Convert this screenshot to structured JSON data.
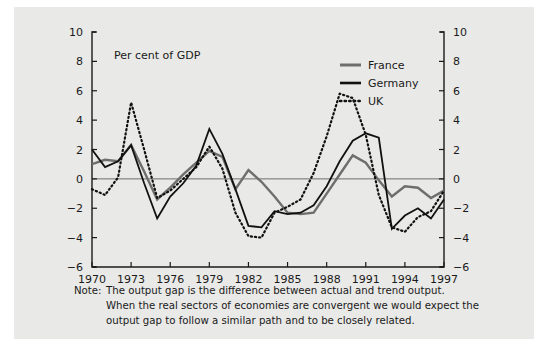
{
  "figure": {
    "background_color": "#e9e9e7",
    "subtitle": "Per cent of GDP",
    "note_label": "Note:",
    "note_lines": [
      "The output gap is the difference between actual and trend output.",
      "When the real sectors of economies are convergent we would expect the",
      "output gap to follow a similar path and to be closely related."
    ]
  },
  "chart_data": {
    "type": "line",
    "title": "",
    "subtitle": "Per cent of GDP",
    "xlabel": "",
    "ylabel": "",
    "ylim": [
      -6,
      10
    ],
    "xlim": [
      1970,
      1997
    ],
    "grid": false,
    "zero_line": true,
    "legend_position": "top-right",
    "y_ticks": [
      10,
      8,
      6,
      4,
      2,
      0,
      -2,
      -4,
      -6
    ],
    "y_tick_labels": [
      "10",
      "8",
      "6",
      "4",
      "2",
      "0",
      "-2",
      "-4",
      "-6"
    ],
    "y_axis_right_labels": [
      "10",
      "8",
      "6",
      "4",
      "2",
      "0",
      "-2",
      "-4",
      "-6"
    ],
    "x_ticks": [
      1970,
      1973,
      1976,
      1979,
      1982,
      1985,
      1988,
      1991,
      1994,
      1997
    ],
    "x_tick_labels": [
      "1970",
      "1973",
      "1976",
      "1979",
      "1982",
      "1985",
      "1988",
      "1991",
      "1994",
      "1997"
    ],
    "x": [
      1970,
      1971,
      1972,
      1973,
      1974,
      1975,
      1976,
      1977,
      1978,
      1979,
      1980,
      1981,
      1982,
      1983,
      1984,
      1985,
      1986,
      1987,
      1988,
      1989,
      1990,
      1991,
      1992,
      1993,
      1994,
      1995,
      1996,
      1997
    ],
    "series": [
      {
        "name": "France",
        "color": "#6e6e6e",
        "style": "solid",
        "values": [
          1.0,
          1.3,
          1.2,
          2.3,
          0.5,
          -1.4,
          -0.6,
          0.3,
          1.1,
          1.9,
          1.5,
          -0.7,
          0.6,
          -0.2,
          -1.2,
          -2.3,
          -2.4,
          -2.3,
          -1.0,
          0.3,
          1.6,
          1.1,
          -0.1,
          -1.2,
          -0.5,
          -0.6,
          -1.3,
          -0.8
        ]
      },
      {
        "name": "Germany",
        "color": "#111111",
        "style": "solid",
        "values": [
          2.0,
          0.8,
          1.2,
          2.3,
          -0.3,
          -2.7,
          -1.2,
          -0.3,
          0.9,
          3.4,
          1.7,
          -0.7,
          -3.2,
          -3.3,
          -2.2,
          -2.4,
          -2.3,
          -1.8,
          -0.5,
          1.2,
          2.6,
          3.1,
          2.8,
          -3.4,
          -2.5,
          -2.0,
          -2.7,
          -1.4
        ]
      },
      {
        "name": "UK",
        "color": "#111111",
        "style": "dotted",
        "values": [
          -0.7,
          -1.1,
          0.1,
          5.2,
          2.0,
          -1.3,
          -0.8,
          0.0,
          0.8,
          2.2,
          0.7,
          -2.3,
          -3.9,
          -4.0,
          -2.3,
          -1.9,
          -1.4,
          0.4,
          2.9,
          5.8,
          5.5,
          3.0,
          -1.1,
          -3.3,
          -3.6,
          -2.6,
          -2.2,
          -0.8
        ]
      }
    ]
  },
  "legend": {
    "items": [
      {
        "label": "France",
        "color": "#6e6e6e",
        "style": "solid"
      },
      {
        "label": "Germany",
        "color": "#111111",
        "style": "solid"
      },
      {
        "label": "UK",
        "color": "#111111",
        "style": "dotted"
      }
    ]
  }
}
